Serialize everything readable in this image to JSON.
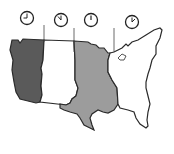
{
  "diagram": {
    "zones": [
      {
        "name": "Pacific",
        "fill": "#5a5a5a",
        "clock_hour": "9"
      },
      {
        "name": "Mountain",
        "fill": "#ffffff",
        "clock_hour": "10"
      },
      {
        "name": "Central",
        "fill": "#9c9c9c",
        "clock_hour": "11"
      },
      {
        "name": "Eastern",
        "fill": "#ffffff",
        "clock_hour": "12"
      }
    ],
    "colors": {
      "outline": "#2a2a2a",
      "background": "#ffffff"
    }
  }
}
